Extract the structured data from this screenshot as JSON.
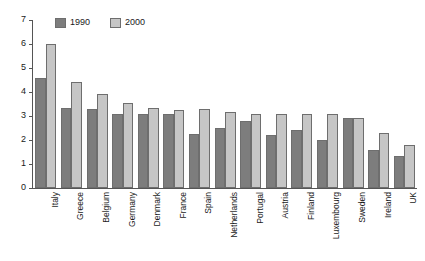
{
  "chart_data": {
    "type": "bar",
    "title": "",
    "subtitle": "",
    "xlabel": "",
    "ylabel": "",
    "ylim": [
      0,
      7
    ],
    "yticks": [
      0,
      1,
      2,
      3,
      4,
      5,
      6,
      7
    ],
    "grid": false,
    "legend_position": "top-left",
    "categories": [
      "Italy",
      "Greece",
      "Belgium",
      "Germany",
      "Denmark",
      "France",
      "Spain",
      "Netherlands",
      "Portugal",
      "Austria",
      "Finland",
      "Luxembourg",
      "Sweden",
      "Ireland",
      "UK"
    ],
    "series": [
      {
        "name": "1990",
        "color": "#7d7d7d",
        "values": [
          4.6,
          3.35,
          3.3,
          3.1,
          3.1,
          3.1,
          2.25,
          2.5,
          2.8,
          2.2,
          2.4,
          2.0,
          2.9,
          1.6,
          1.35
        ]
      },
      {
        "name": "2000",
        "color": "#c6c6c6",
        "values": [
          6.0,
          4.4,
          3.9,
          3.55,
          3.35,
          3.25,
          3.3,
          3.15,
          3.1,
          3.1,
          3.1,
          3.1,
          2.9,
          2.3,
          1.8
        ]
      }
    ]
  },
  "legend": {
    "items": [
      {
        "label": "1990"
      },
      {
        "label": "2000"
      }
    ]
  },
  "axis": {
    "y_tick_labels": [
      "0",
      "1",
      "2",
      "3",
      "4",
      "5",
      "6",
      "7"
    ]
  }
}
